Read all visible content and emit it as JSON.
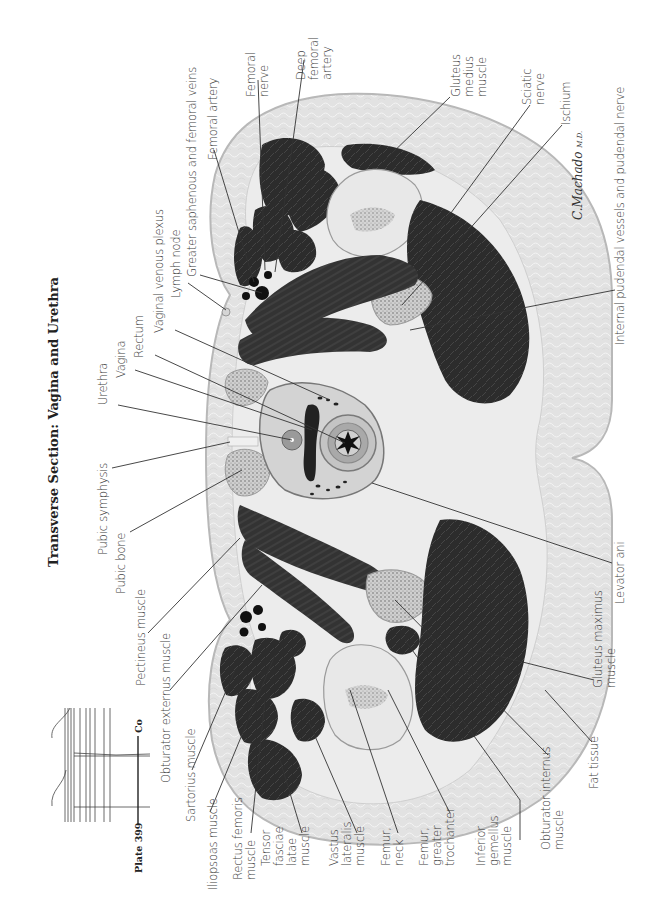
{
  "title": "Transverse Section: Vagina and Urethra",
  "locator": {
    "plate_label": "Plate 399",
    "level_label": "Co"
  },
  "signature": "C.Machado",
  "signature_suffix": "M.D.",
  "labels": {
    "femoral_nerve": "Femoral\nnerve",
    "deep_femoral_artery": "Deep\nfemoral\nartery",
    "femoral_artery": "Femoral artery",
    "greater_saphenous": "Greater saphenous and femoral veins",
    "lymph_node": "Lymph node",
    "vaginal_venous_plexus": "Vaginal venous plexus",
    "rectum": "Rectum",
    "vagina": "Vagina",
    "urethra": "Urethra",
    "pubic_symphysis": "Pubic symphysis",
    "pubic_bone": "Pubic bone",
    "pectineus": "Pectineus muscle",
    "obturator_externus": "Obturator externus muscle",
    "sartorius": "Sartorius muscle",
    "iliopsoas": "Iliopsoas muscle",
    "rectus_femoris": "Rectus femoris\nmuscle",
    "tensor_fasciae_latae": "Tensor\nfasciae\nlatae\nmuscle",
    "vastus_lateralis": "Vastus\nlateralis\nmuscle",
    "femur_neck": "Femur,\nneck",
    "femur_greater_trochanter": "Femur,\ngreater\ntrochanter",
    "inferior_gemellus": "Inferior\ngemellus\nmuscle",
    "obturator_internus": "Obturator internus\nmuscle",
    "fat_tissue": "Fat tissue",
    "gluteus_maximus": "Gluteus maximus\nmuscle",
    "levator_ani": "Levator ani",
    "internal_pudendal": "Internal pudendal vessels and pudendal nerve",
    "ischium": "Ischium",
    "sciatic_nerve": "Sciatic\nnerve",
    "gluteus_medius": "Gluteus\nmedius\nmuscle"
  },
  "colors": {
    "fat": "#e4e4e4",
    "fat_edge": "#bdbdbd",
    "muscle": "#2b2b2b",
    "muscle_mid": "#3d3d3d",
    "bone": "#dcdcdc",
    "bone_marrow": "#8a8a8a",
    "connective": "#f2f2f2",
    "leader": "#333333"
  }
}
